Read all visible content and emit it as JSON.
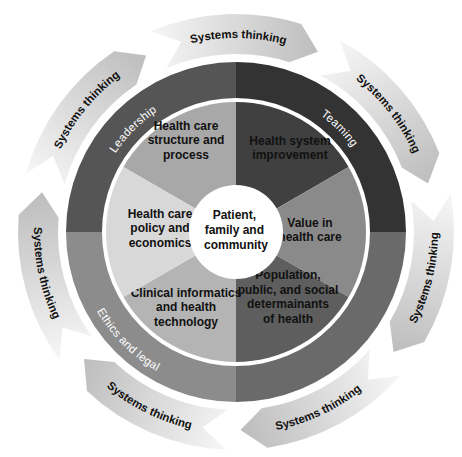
{
  "diagram": {
    "center": {
      "lines": [
        "Patient,",
        "family and",
        "community"
      ],
      "color": "#ffffff"
    },
    "segments": [
      {
        "id": "structure",
        "lines": [
          "Health care",
          "structure and",
          "process"
        ],
        "color": "#a8a8a8",
        "start": 300,
        "end": 360
      },
      {
        "id": "improvement",
        "lines": [
          "Health system",
          "improvement"
        ],
        "color": "#404040",
        "start": 0,
        "end": 60
      },
      {
        "id": "value",
        "lines": [
          "Value in",
          "health care"
        ],
        "color": "#8a8a8a",
        "start": 60,
        "end": 120
      },
      {
        "id": "population",
        "lines": [
          "Population,",
          "public, and social",
          "determainants",
          "of health"
        ],
        "color": "#5e5e5e",
        "start": 120,
        "end": 180
      },
      {
        "id": "informatics",
        "lines": [
          "Clinical informatics",
          "and health",
          "technology"
        ],
        "color": "#b4b4b4",
        "start": 180,
        "end": 240
      },
      {
        "id": "policy",
        "lines": [
          "Health care",
          "policy and",
          "economics"
        ],
        "color": "#d8d8d8",
        "start": 240,
        "end": 300
      }
    ],
    "ring": [
      {
        "id": "leadership",
        "label": "Leadership",
        "color": "#555555",
        "start": 270,
        "end": 360
      },
      {
        "id": "teaming",
        "label": "Teaming",
        "color": "#333333",
        "start": 0,
        "end": 90
      },
      {
        "id": "change",
        "label": "Change agency, management and advocacy",
        "color": "#6a6a6a",
        "start": 90,
        "end": 180
      },
      {
        "id": "ethics",
        "label": "Ethics and legal",
        "color": "#8c8c8c",
        "start": 180,
        "end": 270
      }
    ],
    "arrows": {
      "label": "Systems thinking",
      "count": 7,
      "head_color": "#bdbdbd",
      "tail_color": "#f4f4f4"
    }
  }
}
